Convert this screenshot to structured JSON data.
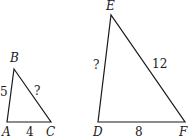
{
  "diagram": {
    "type": "similar-triangles",
    "triangles": [
      {
        "name": "ABC",
        "vertices": {
          "A": {
            "label": "A",
            "x": 7,
            "y": 122
          },
          "B": {
            "label": "B",
            "x": 14,
            "y": 69
          },
          "C": {
            "label": "C",
            "x": 51,
            "y": 122
          }
        },
        "sides": {
          "AB": {
            "label": "5"
          },
          "BC": {
            "label": "?"
          },
          "AC": {
            "label": "4"
          }
        }
      },
      {
        "name": "DEF",
        "vertices": {
          "D": {
            "label": "D",
            "x": 98,
            "y": 122
          },
          "E": {
            "label": "E",
            "x": 111,
            "y": 15
          },
          "F": {
            "label": "F",
            "x": 185,
            "y": 122
          }
        },
        "sides": {
          "DE": {
            "label": "?"
          },
          "EF": {
            "label": "12"
          },
          "DF": {
            "label": "8"
          }
        }
      }
    ],
    "colors": {
      "stroke": "#1a1a1a",
      "background": "#ffffff"
    }
  }
}
